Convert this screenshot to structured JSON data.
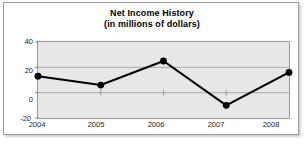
{
  "chart_data": {
    "type": "line",
    "title": "Net Income History",
    "subtitle": "(in millions of dollars)",
    "xlabel": "",
    "ylabel": "",
    "categories": [
      "2004",
      "2005",
      "2006",
      "2007",
      "2008"
    ],
    "values": [
      13,
      6,
      25,
      -10,
      16
    ],
    "ylim": [
      -20,
      40
    ],
    "yticks": [
      40,
      20,
      0,
      -20
    ],
    "ytick_labels": [
      "40",
      "20",
      "0",
      "-20"
    ],
    "grid": true,
    "legend": "none",
    "series_color": "#000000",
    "plot_background": "#e7e7e7",
    "gridline_color": "#9a9a9a",
    "marker": "circle"
  },
  "card": {
    "background": "#ffffff",
    "border_color": "#9a9a9a"
  }
}
